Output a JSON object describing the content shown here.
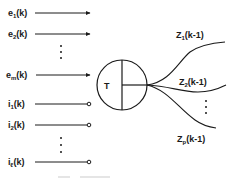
{
  "diagram": {
    "block_label": "T",
    "inputs_e": [
      {
        "base": "e",
        "sub": "1",
        "arg": "(k)"
      },
      {
        "base": "e",
        "sub": "2",
        "arg": "(k)"
      },
      {
        "base": "e",
        "sub": "m",
        "arg": "(k)"
      }
    ],
    "inputs_i": [
      {
        "base": "i",
        "sub": "1",
        "arg": "(k)"
      },
      {
        "base": "i",
        "sub": "2",
        "arg": "(k)"
      },
      {
        "base": "i",
        "sub": "ℓ",
        "arg": "(k)"
      }
    ],
    "outputs_z": [
      {
        "base": "Z",
        "sub": "1",
        "arg": "(k-1)"
      },
      {
        "base": "Z",
        "sub": "2",
        "arg": "(k-1)"
      },
      {
        "base": "Z",
        "sub": "p",
        "arg": "(k-1)"
      }
    ],
    "ellipsis": "⋮",
    "caption": ""
  }
}
